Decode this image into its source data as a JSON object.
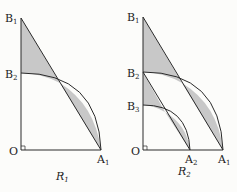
{
  "colors": {
    "line": "#2a2a2a",
    "shade": "#c8c8c8",
    "background": "#fcfcfa"
  },
  "left_figure": {
    "caption": {
      "base": "R",
      "sub": "1"
    },
    "points": {
      "O": {
        "base": "O",
        "sub": ""
      },
      "A1": {
        "base": "A",
        "sub": "1"
      },
      "B1": {
        "base": "B",
        "sub": "1"
      },
      "B2": {
        "base": "B",
        "sub": "2"
      }
    }
  },
  "right_figure": {
    "caption": {
      "base": "R",
      "sub": "2"
    },
    "points": {
      "O": {
        "base": "O",
        "sub": ""
      },
      "A1": {
        "base": "A",
        "sub": "1"
      },
      "A2": {
        "base": "A",
        "sub": "2"
      },
      "B1": {
        "base": "B",
        "sub": "1"
      },
      "B2": {
        "base": "B",
        "sub": "2"
      },
      "B3": {
        "base": "B",
        "sub": "3"
      }
    }
  }
}
